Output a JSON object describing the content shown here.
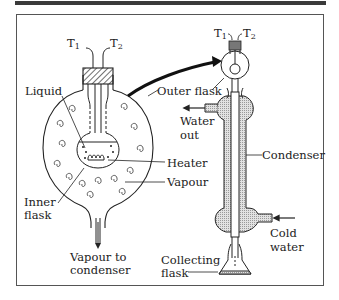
{
  "diagram": {
    "type": "laboratory apparatus",
    "labels": {
      "t1_left": "T",
      "t1_left_sub": "1",
      "t2_left": "T",
      "t2_left_sub": "2",
      "t1_right": "T",
      "t1_right_sub": "1",
      "t2_right": "T",
      "t2_right_sub": "2",
      "liquid": "Liquid",
      "outer_flask": "Outer flask",
      "heater": "Heater",
      "vapour": "Vapour",
      "inner_flask_1": "Inner",
      "inner_flask_2": "flask",
      "vapour_to_1": "Vapour to",
      "vapour_to_2": "condenser",
      "water_out_1": "Water",
      "water_out_2": "out",
      "condenser": "Condenser",
      "cold_water_1": "Cold",
      "cold_water_2": "water",
      "collecting_1": "Collecting",
      "collecting_2": "flask"
    },
    "colors": {
      "line": "#222222",
      "shade": "#cfcfcf",
      "frame": "#555555",
      "topbar": "#3a3a3a"
    }
  }
}
